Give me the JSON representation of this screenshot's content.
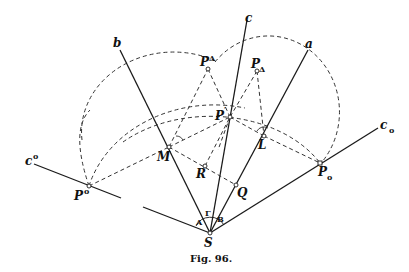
{
  "figure": {
    "caption": "Fig. 96.",
    "labels": {
      "a": "a",
      "b": "b",
      "c": "c",
      "c_o": "c",
      "c_o_sub": "o",
      "c_sup_o": "c",
      "c_sup_o_sup": "o",
      "P_sup_o": "P",
      "P_sup_o_sup": "o",
      "P_o": "P",
      "P_o_sub": "o",
      "P_prime": "P",
      "P_prime_sup": "′",
      "P_sup_delta": "P",
      "P_sup_delta_sup": "Δ",
      "P_delta": "P",
      "P_delta_sub": "Δ",
      "M": "M",
      "L": "L",
      "R": "R",
      "Q": "Q",
      "S": "S",
      "angle_A": "A",
      "angle_B": "B",
      "angle_Gamma": "Γ"
    }
  }
}
